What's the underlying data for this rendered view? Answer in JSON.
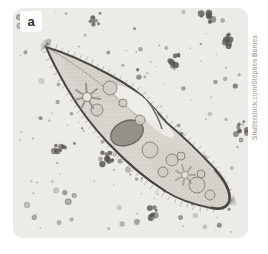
{
  "panel": {
    "label": "a"
  },
  "credit": {
    "text": "Shutterstock.com/Stephen Barnes"
  },
  "colors": {
    "page_bg": "#ffffff",
    "photo_bg": "#ecebe7",
    "body_fill": "#d9d7d0",
    "body_outline": "#4a4842",
    "nucleus_fill": "#8f8d85",
    "nucleus_stroke": "#605e56",
    "vacuole_fill": "#cfcdc5",
    "vacuole_stroke": "#7b7971",
    "debris_dark": "#57554f",
    "cilia": "#6f6d67",
    "credit_text": "#8a8a8a",
    "label_text": "#2e2e2e",
    "label_bg": "#ffffff"
  }
}
